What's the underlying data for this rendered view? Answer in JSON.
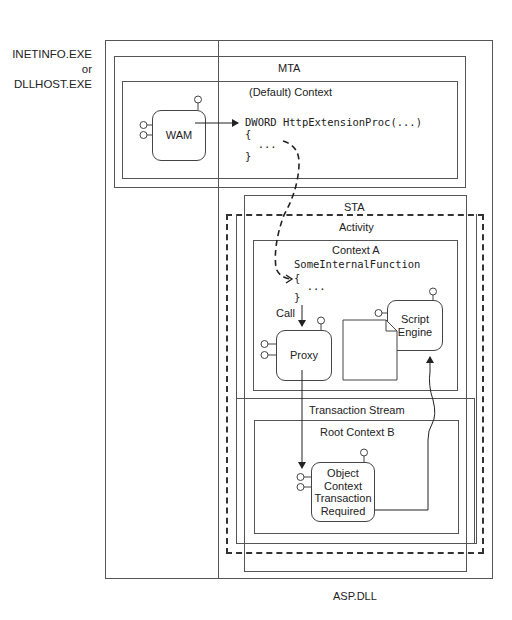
{
  "process": {
    "label_line1": "INETINFO.EXE or",
    "label_line2": "DLLHOST.EXE"
  },
  "mta": {
    "label": "MTA",
    "default_context": {
      "label": "(Default) Context",
      "code_line1": "DWORD HttpExtensionProc(...)",
      "code_line2": "{",
      "code_line3": "  ...",
      "code_line4": "}"
    },
    "wam": {
      "label": "WAM"
    }
  },
  "sta": {
    "label": "STA",
    "activity": {
      "label": "Activity"
    },
    "context_a": {
      "label": "Context A",
      "code_line1": "SomeInternalFunction",
      "code_line2": "{",
      "code_line3": "  ...",
      "code_line4": "}",
      "call_label": "Call",
      "proxy": {
        "label": "Proxy"
      },
      "script_engine": {
        "line1": "Script",
        "line2": "Engine"
      },
      "note": {
        "line1": "@Trans-",
        "line2": "action=",
        "line3": "Required"
      }
    },
    "transaction_stream": {
      "label": "Transaction Stream",
      "root_context_b": {
        "label": "Root Context B",
        "object_context": {
          "line1": "Object",
          "line2": "Context",
          "line3": "Transaction",
          "line4": "Required"
        }
      }
    }
  },
  "asp_dll": {
    "label": "ASP.DLL"
  },
  "colors": {
    "line": "#444444",
    "background": "#ffffff"
  }
}
